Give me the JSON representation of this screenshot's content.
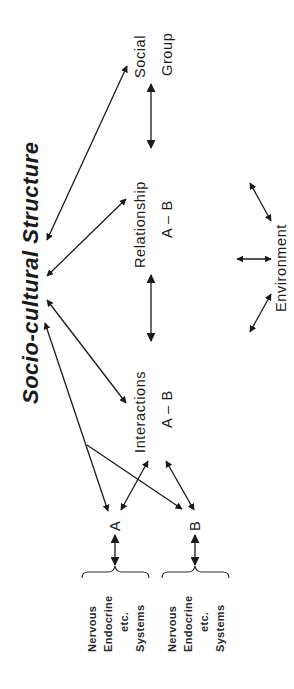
{
  "diagram": {
    "title": "Socio-cultural Structure",
    "orientation": "rotated 90° counter-clockwise",
    "nodes": {
      "social_group": {
        "line1": "Social",
        "line2": "Group"
      },
      "relationship": {
        "line1": "Relationship",
        "line2": "A – B"
      },
      "interactions": {
        "line1": "Interactions",
        "line2": "A – B"
      },
      "environment": {
        "label": "Environment"
      },
      "individual_a": {
        "label": "A"
      },
      "individual_b": {
        "label": "B"
      }
    },
    "systems_a": {
      "lines": [
        "Nervous",
        "Endocrine",
        "etc.",
        "Systems"
      ]
    },
    "systems_b": {
      "lines": [
        "Nervous",
        "Endocrine",
        "etc.",
        "Systems"
      ]
    },
    "edges": [
      {
        "from": "Socio-cultural Structure",
        "to": "Social Group",
        "type": "bidirectional"
      },
      {
        "from": "Socio-cultural Structure",
        "to": "Relationship A – B",
        "type": "bidirectional"
      },
      {
        "from": "Socio-cultural Structure",
        "to": "Interactions A – B",
        "type": "bidirectional"
      },
      {
        "from": "Socio-cultural Structure",
        "to": "A",
        "type": "bidirectional"
      },
      {
        "from": "Socio-cultural Structure",
        "to": "B",
        "type": "directed (branch)"
      },
      {
        "from": "Social Group",
        "to": "Relationship A – B",
        "type": "bidirectional"
      },
      {
        "from": "Relationship A – B",
        "to": "Interactions A – B",
        "type": "bidirectional"
      },
      {
        "from": "Interactions A – B",
        "to": "A",
        "type": "bidirectional"
      },
      {
        "from": "Interactions A – B",
        "to": "B",
        "type": "bidirectional"
      },
      {
        "from": "A",
        "to": "Nervous Endocrine etc. Systems (A)",
        "type": "bidirectional"
      },
      {
        "from": "B",
        "to": "Nervous Endocrine etc. Systems (B)",
        "type": "bidirectional"
      },
      {
        "from": "Environment",
        "to": "Relationship A – B",
        "type": "bidirectional"
      },
      {
        "from": "Environment",
        "to": "Interactions A – B",
        "type": "bidirectional"
      },
      {
        "from": "Environment",
        "to": "(between levels)",
        "type": "bidirectional"
      }
    ],
    "colors": {
      "ink": "#1a1a1a",
      "background": "#ffffff"
    }
  }
}
